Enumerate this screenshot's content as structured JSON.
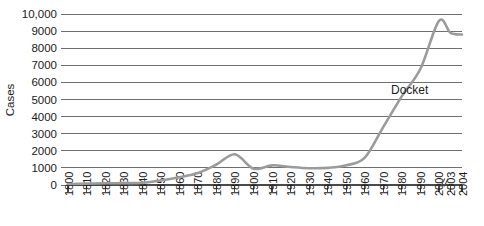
{
  "chart_data": {
    "type": "line",
    "title": "",
    "xlabel": "",
    "ylabel": "Cases",
    "ylim": [
      0,
      10000
    ],
    "ytick_values": [
      0,
      1000,
      2000,
      3000,
      4000,
      5000,
      6000,
      7000,
      8000,
      9000,
      10000
    ],
    "ytick_labels": [
      "0",
      "1000",
      "2000",
      "3000",
      "4000",
      "5000",
      "6000",
      "7000",
      "8000",
      "9000",
      "10,000"
    ],
    "xtick_labels": [
      "1800",
      "1810",
      "1820",
      "1830",
      "1840",
      "1850",
      "1860",
      "1870",
      "1880",
      "1890",
      "1900",
      "1910",
      "1920",
      "1930",
      "1940",
      "1950",
      "1960",
      "1970",
      "1980",
      "1990",
      "2000",
      "2003",
      "2004"
    ],
    "axis_break_after_label": "2000",
    "grid": true,
    "legend_position": "inline-annotation",
    "series": [
      {
        "name": "Docket",
        "annotation": "Docket",
        "x": [
          "1800",
          "1810",
          "1820",
          "1830",
          "1840",
          "1850",
          "1860",
          "1870",
          "1880",
          "1890",
          "1900",
          "1910",
          "1920",
          "1930",
          "1940",
          "1950",
          "1960",
          "1970",
          "1980",
          "1990",
          "2000",
          "2003",
          "2004"
        ],
        "values": [
          60,
          80,
          100,
          110,
          130,
          260,
          450,
          700,
          1200,
          1800,
          950,
          1150,
          1050,
          980,
          1000,
          1150,
          1600,
          3400,
          5200,
          6800,
          9600,
          8900,
          8800
        ]
      }
    ]
  },
  "annotations": {
    "docket_label": "Docket",
    "docket_label_x": "1984",
    "docket_label_y": 5350
  }
}
